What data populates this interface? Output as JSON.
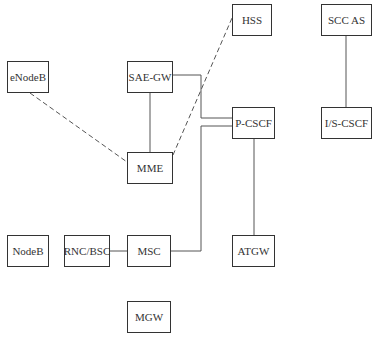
{
  "diagram": {
    "type": "network-architecture",
    "nodes": [
      {
        "id": "enodeb",
        "label": "eNodeB",
        "x": 7,
        "y": 61,
        "w": 42,
        "h": 32
      },
      {
        "id": "sae-gw",
        "label": "SAE-GW",
        "x": 127,
        "y": 61,
        "w": 46,
        "h": 32
      },
      {
        "id": "mme",
        "label": "MME",
        "x": 127,
        "y": 152,
        "w": 46,
        "h": 32
      },
      {
        "id": "hss",
        "label": "HSS",
        "x": 232,
        "y": 4,
        "w": 40,
        "h": 32
      },
      {
        "id": "scc-as",
        "label": "SCC AS",
        "x": 321,
        "y": 4,
        "w": 51,
        "h": 32
      },
      {
        "id": "p-cscf",
        "label": "P-CSCF",
        "x": 232,
        "y": 107,
        "w": 43,
        "h": 32
      },
      {
        "id": "is-cscf",
        "label": "I/S-CSCF",
        "x": 321,
        "y": 107,
        "w": 51,
        "h": 32
      },
      {
        "id": "atgw",
        "label": "ATGW",
        "x": 232,
        "y": 235,
        "w": 43,
        "h": 32
      },
      {
        "id": "nodeb",
        "label": "NodeB",
        "x": 7,
        "y": 235,
        "w": 42,
        "h": 32
      },
      {
        "id": "rnc-bsc",
        "label": "RNC/BSC",
        "x": 64,
        "y": 235,
        "w": 46,
        "h": 32
      },
      {
        "id": "msc",
        "label": "MSC",
        "x": 127,
        "y": 235,
        "w": 44,
        "h": 32
      },
      {
        "id": "mgw",
        "label": "MGW",
        "x": 127,
        "y": 301,
        "w": 44,
        "h": 32
      }
    ],
    "edges": [
      {
        "from": "sae-gw",
        "to": "mme",
        "style": "solid",
        "points": "150,93 150,152"
      },
      {
        "from": "sae-gw",
        "to": "p-cscf",
        "style": "solid",
        "points": "173,75 201,75 201,118 232,118"
      },
      {
        "from": "msc",
        "to": "p-cscf",
        "style": "solid",
        "points": "171,251 201,251 201,126 232,126"
      },
      {
        "from": "p-cscf",
        "to": "atgw",
        "style": "solid",
        "points": "254,139 254,235"
      },
      {
        "from": "scc-as",
        "to": "is-cscf",
        "style": "solid",
        "points": "346,36 346,107"
      },
      {
        "from": "rnc-bsc",
        "to": "msc",
        "style": "solid",
        "points": "110,251 127,251"
      },
      {
        "from": "enodeb",
        "to": "mme",
        "style": "dashed",
        "points": "30,93 127,162"
      },
      {
        "from": "mme",
        "to": "hss",
        "style": "dashed",
        "points": "173,155 232,18"
      }
    ],
    "colors": {
      "line": "#555555",
      "border": "#333333",
      "text": "#333333",
      "background": "#ffffff"
    }
  }
}
